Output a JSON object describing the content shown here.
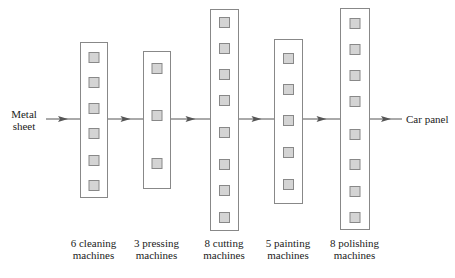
{
  "input": {
    "label_line1": "Metal",
    "label_line2": "sheet"
  },
  "output": {
    "label": "Car panel"
  },
  "colors": {
    "line": "#555555",
    "box_border": "#888888",
    "machine_fill": "#d4d4d4",
    "machine_border": "#888888",
    "text": "#222222"
  },
  "stages": [
    {
      "count": 6,
      "line1": "6 cleaning",
      "line2": "machines",
      "box": {
        "x": 80,
        "y": 42,
        "w": 27,
        "h": 155
      },
      "machines_y": [
        52,
        77,
        103,
        128,
        155,
        180
      ]
    },
    {
      "count": 3,
      "line1": "3 pressing",
      "line2": "machines",
      "box": {
        "x": 143,
        "y": 51,
        "w": 27,
        "h": 137
      },
      "machines_y": [
        63,
        110,
        158
      ]
    },
    {
      "count": 8,
      "line1": "8 cutting",
      "line2": "machines",
      "box": {
        "x": 210,
        "y": 9,
        "w": 28,
        "h": 221
      },
      "machines_y": [
        17,
        43,
        69,
        95,
        127,
        159,
        185,
        212
      ]
    },
    {
      "count": 5,
      "line1": "5 painting",
      "line2": "machines",
      "box": {
        "x": 274,
        "y": 39,
        "w": 28,
        "h": 164
      },
      "machines_y": [
        53,
        84,
        115,
        147,
        179
      ]
    },
    {
      "count": 8,
      "line1": "8 polishing",
      "line2": "machines",
      "box": {
        "x": 340,
        "y": 8,
        "w": 29,
        "h": 221
      },
      "machines_y": [
        18,
        44,
        70,
        96,
        129,
        159,
        186,
        212
      ]
    }
  ],
  "flow_y": 119
}
